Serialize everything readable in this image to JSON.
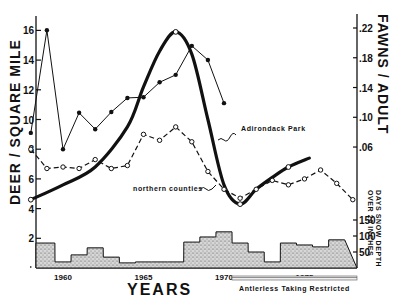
{
  "chart_data": {
    "type": "line",
    "title": "",
    "xlabel": "YEARS",
    "ylabel": "DEER / SQUARE MILE",
    "ylabel_right": "FAWNS / ADULT",
    "ylabel_right_lower": "DAYS SNOW DEPTH OVER 20 INCHES",
    "x_ticks": [
      "1960",
      "1965",
      "1970",
      "1975"
    ],
    "y_ticks": [
      "2",
      "4",
      "6",
      "8",
      "10",
      "12",
      "14",
      "16"
    ],
    "y_right_ticks": [
      ".06",
      ".10",
      ".14",
      ".18",
      ".22"
    ],
    "snow_ticks": [
      "50",
      "100",
      "150"
    ],
    "ylim": [
      0,
      16.5
    ],
    "xlim": [
      1958,
      1978
    ],
    "grid": false,
    "annotations": [
      "Adirondack Park",
      "northern counties",
      "Antlerless Taking Restricted"
    ],
    "restriction_period": [
      1970.5,
      1978
    ],
    "series": [
      {
        "name": "Adirondack Park (deer/sq mi)",
        "style": "thick-solid",
        "x": [
          1958,
          1960,
          1962,
          1964,
          1965,
          1966,
          1967,
          1968,
          1969,
          1970,
          1971,
          1972,
          1973,
          1974,
          1975.3
        ],
        "values": [
          4.6,
          5.6,
          6.8,
          9.5,
          12.2,
          14.6,
          15.9,
          14.4,
          10.0,
          5.6,
          4.3,
          5.3,
          6.1,
          6.8,
          7.4
        ]
      },
      {
        "name": "northern counties (deer/sq mi)",
        "style": "dashed-open-circles",
        "x": [
          1958,
          1959,
          1960,
          1961,
          1962,
          1963,
          1964,
          1965,
          1966,
          1967,
          1968,
          1969,
          1970,
          1971,
          1972,
          1973,
          1974,
          1975,
          1976,
          1977,
          1978
        ],
        "values": [
          8.0,
          6.7,
          6.8,
          6.7,
          7.3,
          6.7,
          6.9,
          9.0,
          8.6,
          9.5,
          8.5,
          6.5,
          5.3,
          4.7,
          5.3,
          5.9,
          5.6,
          6.0,
          6.6,
          5.7,
          4.6
        ]
      },
      {
        "name": "Fawns / adult",
        "style": "thin-solid-dots",
        "axis": "right",
        "x": [
          1958,
          1959,
          1960,
          1961,
          1962,
          1963,
          1964,
          1965,
          1966,
          1967,
          1968,
          1969,
          1970
        ],
        "values": [
          0.079,
          0.217,
          0.057,
          0.106,
          0.084,
          0.107,
          0.126,
          0.127,
          0.147,
          0.157,
          0.196,
          0.177,
          0.119
        ]
      },
      {
        "name": "Days snow depth over 20 inches",
        "style": "stippled-step-bars",
        "axis": "right-lower",
        "x": [
          1958,
          1959,
          1960,
          1961,
          1962,
          1963,
          1964,
          1965,
          1966,
          1967,
          1968,
          1969,
          1970,
          1971,
          1972,
          1973,
          1974,
          1975,
          1976,
          1977
        ],
        "values": [
          78,
          78,
          19,
          41,
          63,
          34,
          16,
          19,
          19,
          19,
          81,
          97,
          113,
          78,
          50,
          19,
          78,
          72,
          66,
          88
        ]
      }
    ]
  }
}
